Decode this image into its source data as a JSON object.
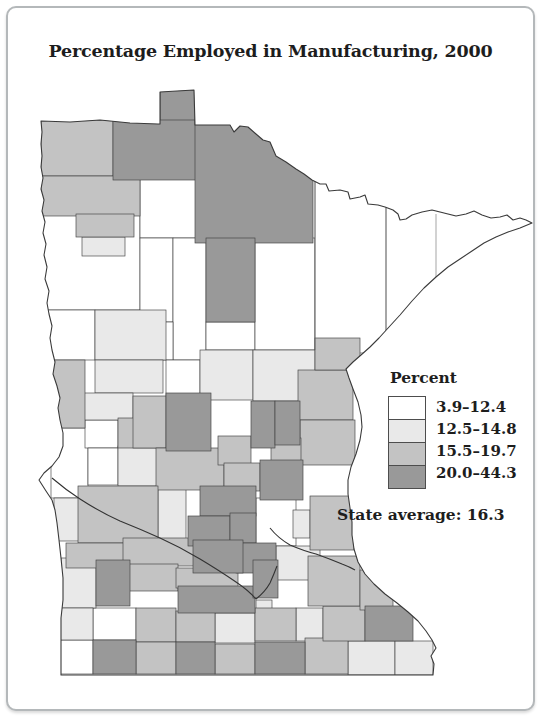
{
  "title": "Percentage Employed in Manufacturing, 2000",
  "legend": {
    "heading": "Percent",
    "classes": [
      {
        "label": "3.9–12.4",
        "color": "#ffffff"
      },
      {
        "label": "12.5–14.8",
        "color": "#e9e9e9"
      },
      {
        "label": "15.5–19.7",
        "color": "#c3c3c3"
      },
      {
        "label": "20.0–44.3",
        "color": "#999999"
      }
    ]
  },
  "state_average": "State average: 16.3",
  "map": {
    "outline_color": "#3a3a3a",
    "cell_line_color": "#424242",
    "county_line_color": "#6a6a6a",
    "river_color": "#333333",
    "outline": "M 33,113 L 62,114 L 92,112 L 122,115 L 150,116 L 152,116 L 152,84 L 186,82 L 187,117 L 200,117 L 222,117 L 226,124 L 232,118 L 240,119 L 248,126 L 255,132 L 262,134 L 268,148 L 278,154 L 288,161 L 296,166 L 304,172 L 312,176 L 318,176 L 321,183 L 332,182 L 340,184 L 342,191 L 352,189 L 357,187 L 360,196 L 370,197 L 377,199 L 385,202 L 390,206 L 392,212 L 398,211 L 404,207 L 414,204 L 424,202 L 436,205 L 448,208 L 458,206 L 466,203 L 474,207 L 483,210 L 492,209 L 499,207 L 505,212 L 512,210 L 518,212 L 524,215 L 512,220 L 500,224 L 488,229 L 476,235 L 464,243 L 452,251 L 440,259 L 428,269 L 416,280 L 404,293 L 392,307 L 381,319 L 371,330 L 362,339 L 353,347 L 345,354 L 338,361 L 341,370 L 345,381 L 350,394 L 353,407 L 354,419 L 352,432 L 348,446 L 343,459 L 340,472 L 340,486 L 342,500 L 344,514 L 344,527 L 346,541 L 350,554 L 357,566 L 366,576 L 377,586 L 389,595 L 400,604 L 410,613 L 418,623 L 424,632 L 428,640 L 423,648 L 426,656 L 425,667 L 53,667 L 53,640 L 53,610 L 55,592 L 55,570 L 53,550 L 51,532 L 49,515 L 47,502 L 44,492 L 38,483 L 31,472 L 36,465 L 44,458 L 51,449 L 55,438 L 55,425 L 52,412 L 50,400 L 52,390 L 49,378 L 45,366 L 47,354 L 44,342 L 42,330 L 44,318 L 41,306 L 39,295 L 41,283 L 37,271 L 39,259 L 36,247 L 38,236 L 35,225 L 37,214 L 34,203 L 36,192 L 33,181 L 35,170 L 33,159 L 34,148 L 33,136 L 34,124 Z",
    "county_lines": [
      "M 307,164 L 307,342",
      "M 378,200 L 378,327",
      "M 428,206 L 428,271"
    ],
    "rivers": [
      "M 44,470 Q 58,482 72,491 Q 92,504 112,513 Q 132,521 152,530 Q 172,539 192,551 Q 212,563 228,574 Q 240,582 248,591 Q 257,584 262,575 Q 266,566 269,558",
      "M 262,520 Q 270,530 282,537 Q 296,543 308,546 Q 322,551 334,556 Q 342,559 347,562"
    ],
    "cells": [
      [
        33,
        207,
        99,
        95,
        0
      ],
      [
        132,
        168,
        68,
        62,
        0
      ],
      [
        33,
        302,
        54,
        50,
        0
      ],
      [
        43,
        420,
        37,
        70,
        0
      ],
      [
        77,
        412,
        33,
        28,
        0
      ],
      [
        80,
        440,
        30,
        37,
        0
      ],
      [
        248,
        490,
        40,
        48,
        0
      ],
      [
        85,
        600,
        43,
        32,
        0
      ],
      [
        50,
        632,
        35,
        34,
        0
      ],
      [
        132,
        230,
        33,
        84,
        0
      ],
      [
        165,
        230,
        33,
        122,
        0
      ],
      [
        198,
        314,
        49,
        28,
        0
      ],
      [
        247,
        230,
        60,
        112,
        0
      ],
      [
        307,
        160,
        71,
        185,
        0
      ],
      [
        132,
        314,
        33,
        38,
        0
      ],
      [
        158,
        352,
        34,
        36,
        0
      ],
      [
        74,
        229,
        43,
        19,
        1
      ],
      [
        87,
        302,
        71,
        50,
        1
      ],
      [
        87,
        352,
        68,
        33,
        1
      ],
      [
        75,
        385,
        50,
        27,
        1
      ],
      [
        110,
        438,
        42,
        40,
        1
      ],
      [
        150,
        480,
        28,
        53,
        1
      ],
      [
        46,
        490,
        39,
        43,
        1
      ],
      [
        53,
        550,
        35,
        50,
        1
      ],
      [
        50,
        600,
        35,
        32,
        1
      ],
      [
        268,
        538,
        44,
        34,
        1
      ],
      [
        285,
        502,
        17,
        28,
        1
      ],
      [
        192,
        342,
        53,
        50,
        1
      ],
      [
        245,
        342,
        62,
        51,
        1
      ],
      [
        207,
        605,
        40,
        30,
        1
      ],
      [
        288,
        600,
        27,
        33,
        1
      ],
      [
        340,
        633,
        47,
        34,
        1
      ],
      [
        387,
        633,
        38,
        34,
        1
      ],
      [
        248,
        592,
        16,
        20,
        1
      ],
      [
        33,
        112,
        72,
        56,
        2
      ],
      [
        33,
        168,
        99,
        40,
        2
      ],
      [
        68,
        206,
        58,
        23,
        2
      ],
      [
        43,
        352,
        34,
        68,
        2
      ],
      [
        110,
        410,
        45,
        30,
        2
      ],
      [
        125,
        388,
        33,
        52,
        2
      ],
      [
        148,
        440,
        68,
        42,
        2
      ],
      [
        210,
        428,
        33,
        29,
        2
      ],
      [
        216,
        455,
        36,
        28,
        2
      ],
      [
        70,
        478,
        80,
        57,
        2
      ],
      [
        58,
        535,
        80,
        25,
        2
      ],
      [
        115,
        530,
        103,
        28,
        2
      ],
      [
        120,
        556,
        50,
        27,
        2
      ],
      [
        168,
        560,
        62,
        20,
        2
      ],
      [
        128,
        600,
        40,
        34,
        2
      ],
      [
        168,
        603,
        39,
        31,
        2
      ],
      [
        128,
        634,
        40,
        32,
        2
      ],
      [
        207,
        636,
        40,
        30,
        2
      ],
      [
        297,
        630,
        43,
        36,
        2
      ],
      [
        247,
        600,
        41,
        33,
        2
      ],
      [
        315,
        598,
        42,
        35,
        2
      ],
      [
        300,
        548,
        52,
        50,
        2
      ],
      [
        352,
        562,
        33,
        40,
        2
      ],
      [
        302,
        488,
        44,
        54,
        2
      ],
      [
        290,
        362,
        55,
        50,
        2
      ],
      [
        307,
        330,
        45,
        32,
        2
      ],
      [
        292,
        412,
        55,
        45,
        2
      ],
      [
        263,
        430,
        30,
        27,
        2
      ],
      [
        152,
        82,
        35,
        36,
        3
      ],
      [
        105,
        112,
        100,
        60,
        3
      ],
      [
        187,
        112,
        118,
        123,
        3
      ],
      [
        198,
        230,
        49,
        84,
        3
      ],
      [
        158,
        385,
        45,
        58,
        3
      ],
      [
        243,
        393,
        24,
        47,
        3
      ],
      [
        267,
        393,
        25,
        44,
        3
      ],
      [
        252,
        452,
        43,
        40,
        3
      ],
      [
        192,
        478,
        56,
        30,
        3
      ],
      [
        180,
        508,
        42,
        30,
        3
      ],
      [
        222,
        505,
        26,
        30,
        3
      ],
      [
        228,
        535,
        40,
        30,
        3
      ],
      [
        185,
        532,
        50,
        33,
        3
      ],
      [
        170,
        578,
        77,
        27,
        3
      ],
      [
        245,
        552,
        25,
        38,
        3
      ],
      [
        88,
        552,
        34,
        46,
        3
      ],
      [
        85,
        632,
        43,
        34,
        3
      ],
      [
        168,
        634,
        39,
        32,
        3
      ],
      [
        247,
        634,
        50,
        32,
        3
      ],
      [
        357,
        598,
        48,
        35,
        3
      ]
    ]
  }
}
